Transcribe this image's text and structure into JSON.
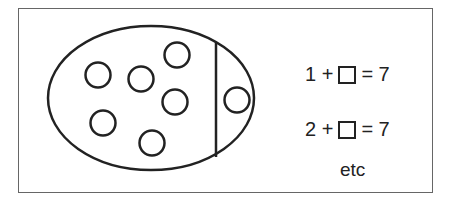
{
  "diagram": {
    "left_section_dots": 6,
    "right_section_dots": 1,
    "total_dots": 7,
    "equations": [
      {
        "addend": "1",
        "plus": "+",
        "equals": "= 7"
      },
      {
        "addend": "2",
        "plus": "+",
        "equals": "= 7"
      }
    ],
    "continuation": "etc",
    "colors": {
      "stroke": "#222222",
      "frame": "#666666",
      "background": "#ffffff"
    }
  }
}
